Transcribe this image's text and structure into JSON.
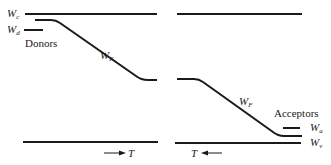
{
  "figure": {
    "left_panel": {
      "conduction_band_label": "W",
      "conduction_band_sub": "c",
      "donor_level_label": "W",
      "donor_level_sub": "d",
      "impurity_label": "Donors",
      "fermi_label": "W",
      "fermi_sub": "F",
      "temperature_label": "T",
      "temperature_direction": "increasing to right"
    },
    "right_panel": {
      "fermi_label": "W",
      "fermi_sub": "F",
      "impurity_label": "Acceptors",
      "acceptor_level_label": "W",
      "acceptor_level_sub": "a",
      "valence_band_label": "W",
      "valence_band_sub": "v",
      "temperature_label": "T",
      "temperature_direction": "increasing to left"
    },
    "colors": {
      "ink": "#1a1a1a",
      "background": "#ffffff"
    }
  }
}
